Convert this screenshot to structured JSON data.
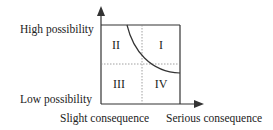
{
  "diagram": {
    "type": "risk-matrix",
    "y_axis": {
      "high_label": "High possibility",
      "low_label": "Low possibility"
    },
    "x_axis": {
      "low_label": "Slight consequence",
      "high_label": "Serious consequence"
    },
    "quadrants": [
      {
        "id": "I",
        "label": "I",
        "position": "top-right"
      },
      {
        "id": "II",
        "label": "II",
        "position": "top-left"
      },
      {
        "id": "III",
        "label": "III",
        "position": "bottom-left"
      },
      {
        "id": "IV",
        "label": "IV",
        "position": "bottom-right"
      }
    ],
    "colors": {
      "line": "#333333",
      "divider": "#888888"
    }
  }
}
